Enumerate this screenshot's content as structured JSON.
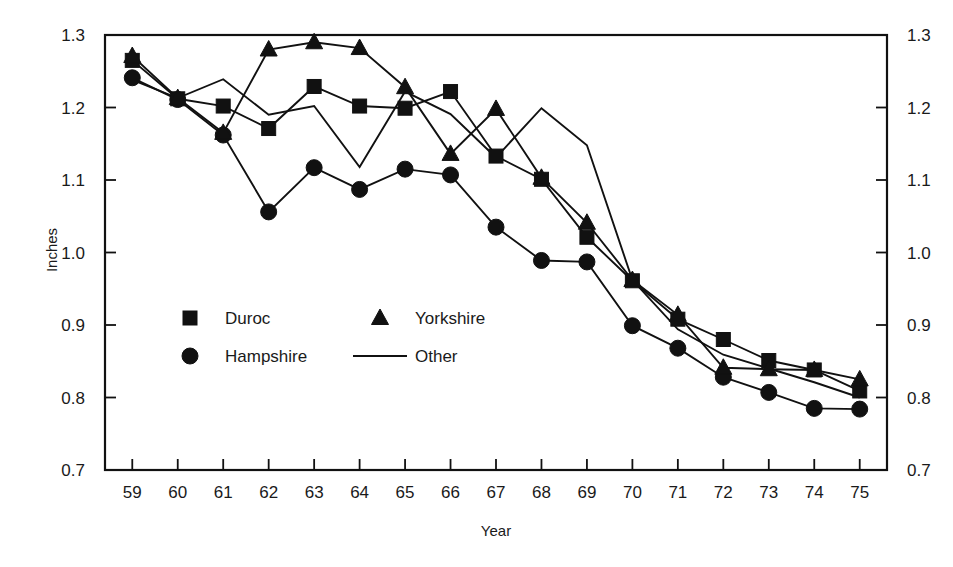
{
  "chart_data": {
    "type": "line",
    "title": "",
    "xlabel": "Year",
    "ylabel": "Inches",
    "x": [
      59,
      60,
      61,
      62,
      63,
      64,
      65,
      66,
      67,
      68,
      69,
      70,
      71,
      72,
      73,
      74,
      75
    ],
    "xtick_labels": [
      "59",
      "60",
      "61",
      "62",
      "63",
      "64",
      "65",
      "66",
      "67",
      "68",
      "69",
      "70",
      "71",
      "72",
      "73",
      "74",
      "75"
    ],
    "ytick_labels": [
      "0.7",
      "0.8",
      "0.9",
      "1.0",
      "1.1",
      "1.2",
      "1.3"
    ],
    "ylim": [
      0.7,
      1.3
    ],
    "xlim": [
      58.4,
      75.6
    ],
    "grid": false,
    "legend_position": "inside-lower-left",
    "series": [
      {
        "name": "Duroc",
        "marker": "square",
        "values": [
          1.265,
          1.212,
          1.202,
          1.171,
          1.229,
          1.202,
          1.199,
          1.222,
          1.133,
          1.101,
          1.021,
          0.961,
          0.908,
          0.88,
          0.851,
          0.838,
          0.809
        ]
      },
      {
        "name": "Hampshire",
        "marker": "circle",
        "values": [
          1.241,
          1.211,
          1.162,
          1.056,
          1.117,
          1.087,
          1.115,
          1.107,
          1.035,
          0.989,
          0.987,
          0.899,
          0.868,
          0.828,
          0.807,
          0.785,
          0.784
        ]
      },
      {
        "name": "Yorkshire",
        "marker": "triangle",
        "values": [
          1.271,
          1.213,
          1.165,
          1.28,
          1.29,
          1.282,
          1.228,
          1.136,
          1.198,
          1.103,
          1.041,
          0.962,
          0.914,
          0.841,
          0.839,
          0.838,
          0.825
        ]
      },
      {
        "name": "Other",
        "marker": "none",
        "values": [
          1.238,
          1.213,
          1.239,
          1.19,
          1.202,
          1.118,
          1.222,
          1.191,
          1.131,
          1.199,
          1.148,
          0.962,
          0.894,
          0.859,
          0.84,
          0.821,
          0.8
        ]
      }
    ]
  },
  "legend": {
    "items": [
      {
        "label": "Duroc",
        "marker": "square"
      },
      {
        "label": "Yorkshire",
        "marker": "triangle"
      },
      {
        "label": "Hampshire",
        "marker": "circle"
      },
      {
        "label": "Other",
        "marker": "line"
      }
    ]
  },
  "axes": {
    "y_title": "Inches",
    "x_title": "Year"
  }
}
